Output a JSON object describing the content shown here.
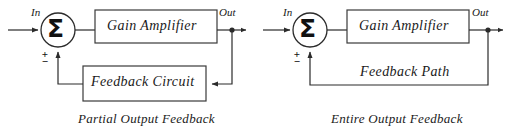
{
  "figure": {
    "kind": "block-diagram-pair",
    "background_color": "#ffffff",
    "line_color": "#2b2b2b"
  },
  "diagrams": [
    {
      "id": "partial-output-feedback",
      "caption": "Partial Output Feedback",
      "input_label": "In",
      "output_label": "Out",
      "summing_symbol": "Σ",
      "sign_plus": "+",
      "sign_minus": "−",
      "blocks": [
        {
          "name": "gain-amplifier",
          "label": "Gain Amplifier"
        },
        {
          "name": "feedback-circuit",
          "label": "Feedback Circuit"
        }
      ]
    },
    {
      "id": "entire-output-feedback",
      "caption": "Entire Output Feedback",
      "input_label": "In",
      "output_label": "Out",
      "summing_symbol": "Σ",
      "sign_plus": "+",
      "sign_minus": "−",
      "blocks": [
        {
          "name": "gain-amplifier",
          "label": "Gain Amplifier"
        }
      ],
      "path_label": "Feedback Path"
    }
  ]
}
